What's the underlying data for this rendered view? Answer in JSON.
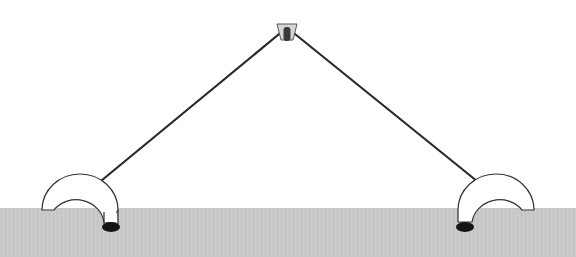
{
  "diagram": {
    "type": "illustration",
    "colors": {
      "background": "#ffffff",
      "ground": "#c8c8c8",
      "line": "#2a2a2a",
      "hole": "#151515",
      "peg": "#9a9a9a"
    },
    "elements": {
      "peg": {
        "label": "",
        "x": 286,
        "y": 18
      },
      "left_hoop": {
        "label": "",
        "x": 78,
        "y": 208
      },
      "right_hoop": {
        "label": "",
        "x": 496,
        "y": 208
      },
      "ground_level_y": 208
    }
  }
}
